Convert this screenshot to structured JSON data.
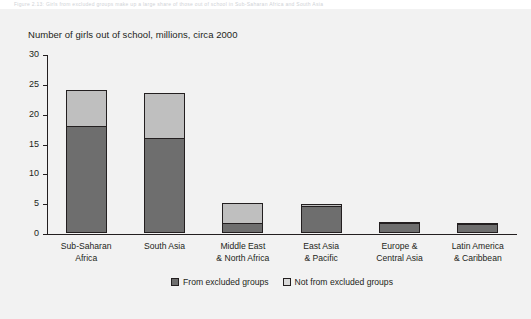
{
  "figure": {
    "background_color": "#f2f2f2",
    "caption_strip_text": "Figure 2.13:  Girls from excluded groups make up a large share of those out of school in Sub-Saharan Africa and South Asia"
  },
  "chart_data": {
    "type": "bar",
    "stacked": true,
    "title": "Number of girls out of school, millions, circa 2000",
    "xlabel": "",
    "ylabel": "",
    "ylim": [
      0,
      30
    ],
    "yticks": [
      0,
      5,
      10,
      15,
      20,
      25,
      30
    ],
    "ytick_labels": [
      "0",
      "5",
      "10",
      "15",
      "20",
      "25",
      "30"
    ],
    "grid": false,
    "legend_position": "bottom-center",
    "categories": [
      "Sub-Saharan\nAfrica",
      "South Asia",
      "Middle East\n& North Africa",
      "East Asia\n& Pacific",
      "Europe &\nCentral Asia",
      "Latin America\n& Caribbean"
    ],
    "category_lines": [
      [
        "Sub-Saharan",
        "Africa"
      ],
      [
        "South Asia",
        ""
      ],
      [
        "Middle East",
        "& North Africa"
      ],
      [
        "East Asia",
        "& Pacific"
      ],
      [
        "Europe &",
        "Central Asia"
      ],
      [
        "Latin America",
        "& Caribbean"
      ]
    ],
    "series": [
      {
        "name": "From excluded groups",
        "color": "#6e6e6e",
        "values": [
          18.0,
          16.0,
          1.7,
          4.5,
          1.6,
          1.5
        ]
      },
      {
        "name": "Not from excluded groups",
        "color": "#bfbfbf",
        "values": [
          6.0,
          7.5,
          3.4,
          0.4,
          0.2,
          0.1
        ]
      }
    ],
    "totals": [
      24.0,
      23.5,
      5.1,
      4.9,
      1.8,
      1.6
    ]
  },
  "legend": {
    "items": [
      {
        "label": "From excluded groups",
        "swatch": "dark"
      },
      {
        "label": "Not from excluded groups",
        "swatch": "light"
      }
    ]
  },
  "colors": {
    "dark_segment": "#6e6e6e",
    "light_segment": "#bfbfbf",
    "axis": "#231f20",
    "text": "#231f20",
    "background": "#f2f2f2"
  }
}
